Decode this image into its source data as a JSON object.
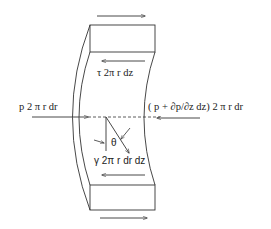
{
  "diagram": {
    "type": "free-body diagram of fluid annular element",
    "labels": {
      "shear_force": "τ 2π r dz",
      "left_pressure": "p 2 π r dr",
      "right_pressure": "( p +  ∂p/∂z dz) 2 π r dr",
      "angle": "θ",
      "weight": "γ 2π r dr dz"
    },
    "colors": {
      "stroke": "#333333",
      "text": "#222222",
      "background": "#ffffff"
    }
  }
}
